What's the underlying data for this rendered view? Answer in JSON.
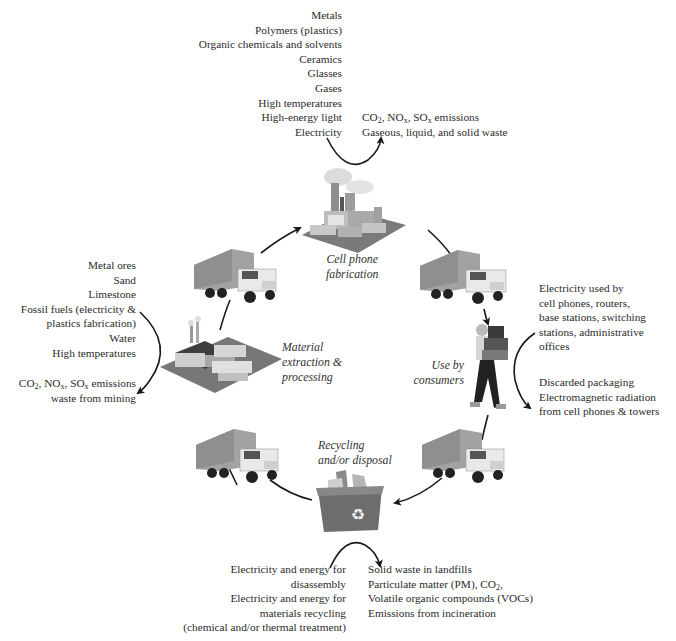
{
  "diagram": {
    "stages": {
      "fabrication": {
        "label_lines": [
          "Cell phone",
          "fabrication"
        ],
        "inputs": [
          "Metals",
          "Polymers (plastics)",
          "Organic chemicals and solvents",
          "Ceramics",
          "Glasses",
          "Gases",
          "High temperatures",
          "High-energy light",
          "Electricity"
        ],
        "outputs": {
          "emissions_prefix": "CO",
          "emissions_line": "CO2, NOx, SOx emissions",
          "waste": "Gaseous, liquid, and solid waste"
        }
      },
      "extraction": {
        "label_lines": [
          "Material",
          "extraction &",
          "processing"
        ],
        "inputs": [
          "Metal ores",
          "Sand",
          "Limestone",
          "Fossil fuels (electricity &",
          "plastics fabrication)",
          "Water",
          "High temperatures"
        ],
        "outputs": {
          "emissions_line": "CO2, NOx, SOx emissions",
          "waste": "waste from mining"
        }
      },
      "use": {
        "label_lines": [
          "Use by",
          "consumers"
        ],
        "inputs": [
          "Electricity used by",
          "cell phones, routers,",
          "base stations, switching",
          "stations, administrative",
          "offices"
        ],
        "outputs": [
          "Discarded packaging",
          "Electromagnetic radiation",
          "from cell phones & towers"
        ]
      },
      "recycling": {
        "label_lines": [
          "Recycling",
          "and/or disposal"
        ],
        "inputs": [
          "Electricity and energy for",
          "disassembly",
          "Electricity and energy for",
          "materials recycling",
          "(chemical and/or thermal treatment)"
        ],
        "outputs": [
          "Solid waste in landfills",
          "Particulate matter (PM), CO2,",
          "Volatile organic compounds (VOCs)",
          "Emissions from incineration"
        ]
      }
    },
    "icons": {
      "factory": "factory-icon",
      "plant": "processing-plant-icon",
      "truck": "truck-icon",
      "consumer": "person-carrying-boxes-icon",
      "bin": "recycling-bin-icon",
      "recycle_symbol": "♻"
    },
    "colors": {
      "text": "#2a2a2a",
      "arrow": "#1a1a1a",
      "truck_box": "#9a9a9a",
      "bin": "#6d6d6d",
      "ground": "#7a7a7a"
    }
  }
}
